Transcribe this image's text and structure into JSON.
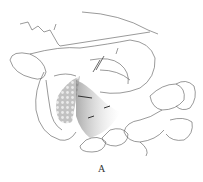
{
  "figure": {
    "caption": "A",
    "colors": {
      "line": "#555555",
      "shade": "#888888",
      "background": "#ffffff"
    }
  }
}
